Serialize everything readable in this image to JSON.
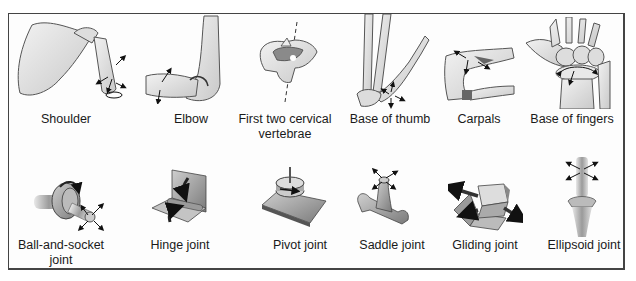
{
  "figure": {
    "rows": [
      {
        "name": "anatomical-examples",
        "items": [
          {
            "id": "shoulder",
            "label": "Shoulder"
          },
          {
            "id": "elbow",
            "label": "Elbow"
          },
          {
            "id": "cervical",
            "label": "First two cervical vertebrae"
          },
          {
            "id": "thumb",
            "label": "Base of thumb"
          },
          {
            "id": "carpals",
            "label": "Carpals"
          },
          {
            "id": "fingers",
            "label": "Base of fingers"
          }
        ]
      },
      {
        "name": "mechanical-models",
        "items": [
          {
            "id": "ball-socket",
            "label": "Ball-and-socket joint"
          },
          {
            "id": "hinge",
            "label": "Hinge joint"
          },
          {
            "id": "pivot",
            "label": "Pivot joint"
          },
          {
            "id": "saddle",
            "label": "Saddle joint"
          },
          {
            "id": "gliding",
            "label": "Gliding joint"
          },
          {
            "id": "ellipsoid",
            "label": "Ellipsoid joint"
          }
        ]
      }
    ],
    "colors": {
      "border": "#444444",
      "bone_fill": "#e6e6e6",
      "bone_stroke": "#555555",
      "model_fill": "#a8a8a8",
      "model_dark": "#6e6e6e",
      "arrow": "#111111",
      "text": "#1a1a1a"
    }
  }
}
